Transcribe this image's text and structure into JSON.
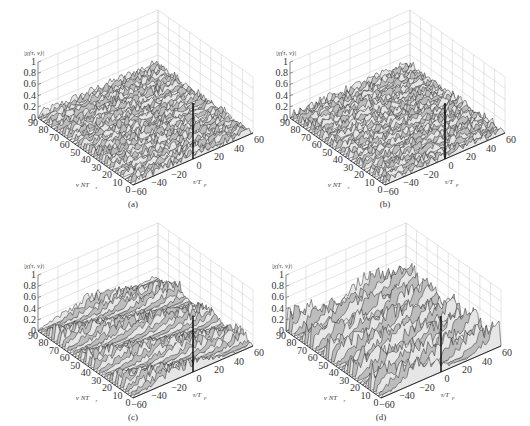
{
  "figure": {
    "panels": [
      {
        "id": "a",
        "caption": "(a)",
        "pattern": "noise",
        "offset": [
          0,
          0
        ]
      },
      {
        "id": "b",
        "caption": "(b)",
        "pattern": "noise",
        "offset": [
          252,
          0
        ]
      },
      {
        "id": "c",
        "caption": "(c)",
        "pattern": "ridges-light",
        "offset": [
          0,
          213
        ]
      },
      {
        "id": "d",
        "caption": "(d)",
        "pattern": "ridges-strong",
        "offset": [
          248,
          213
        ]
      }
    ]
  },
  "chart_data": [
    {
      "type": "surface3d",
      "panel": "(a)",
      "zlabel": "|χ(τ, ν)|",
      "xlabel": "τ/T_p",
      "ylabel": "ν NT_r",
      "zticks": [
        "0",
        "0.2",
        "0.4",
        "0.6",
        "0.8",
        "1"
      ],
      "xticks": [
        "-60",
        "-40",
        "-20",
        "0",
        "20",
        "40",
        "60"
      ],
      "yticks": [
        "0",
        "10",
        "20",
        "30",
        "40",
        "50",
        "60",
        "70",
        "80",
        "90"
      ],
      "zlim": [
        0,
        1
      ],
      "xlim": [
        -60,
        60
      ],
      "ylim": [
        0,
        90
      ],
      "peak": {
        "tau": 0,
        "nu": 0,
        "value": 1
      },
      "sidelobe_level": 0.15,
      "grid": true
    },
    {
      "type": "surface3d",
      "panel": "(b)",
      "zlabel": "|χ(τ, ν)|",
      "xlabel": "τ/T_p",
      "ylabel": "ν NT_r",
      "zticks": [
        "0",
        "0.2",
        "0.4",
        "0.6",
        "0.8",
        "1"
      ],
      "xticks": [
        "-60",
        "-40",
        "-20",
        "0",
        "20",
        "40",
        "60"
      ],
      "yticks": [
        "0",
        "10",
        "20",
        "30",
        "40",
        "50",
        "60",
        "70",
        "80",
        "90"
      ],
      "zlim": [
        0,
        1
      ],
      "xlim": [
        -60,
        60
      ],
      "ylim": [
        0,
        90
      ],
      "peak": {
        "tau": 0,
        "nu": 0,
        "value": 1
      },
      "sidelobe_level": 0.15,
      "grid": true
    },
    {
      "type": "surface3d",
      "panel": "(c)",
      "zlabel": "|χ(τ, ν)|",
      "xlabel": "τ/T_p",
      "ylabel": "ν NT_r",
      "zticks": [
        "0",
        "0.2",
        "0.4",
        "0.6",
        "0.8",
        "1"
      ],
      "xticks": [
        "-60",
        "-40",
        "-20",
        "0",
        "20",
        "40",
        "60"
      ],
      "yticks": [
        "0",
        "10",
        "20",
        "30",
        "40",
        "50",
        "60",
        "70",
        "80",
        "90"
      ],
      "zlim": [
        0,
        1
      ],
      "xlim": [
        -60,
        60
      ],
      "ylim": [
        0,
        90
      ],
      "peak": {
        "tau": 0,
        "nu": 0,
        "value": 1
      },
      "sidelobe_level": 0.2,
      "grid": true
    },
    {
      "type": "surface3d",
      "panel": "(d)",
      "zlabel": "|χ(τ, ν)|",
      "xlabel": "τ/T_p",
      "ylabel": "ν NT_r",
      "zticks": [
        "0",
        "0.2",
        "0.4",
        "0.6",
        "0.8",
        "1"
      ],
      "xticks": [
        "-60",
        "-40",
        "-20",
        "0",
        "20",
        "40",
        "60"
      ],
      "yticks": [
        "0",
        "10",
        "20",
        "30",
        "40",
        "50",
        "60",
        "70",
        "80",
        "90"
      ],
      "zlim": [
        0,
        1
      ],
      "xlim": [
        -60,
        60
      ],
      "ylim": [
        0,
        90
      ],
      "peak": {
        "tau": 0,
        "nu": 0,
        "value": 1
      },
      "sidelobe_level": 0.3,
      "grid": true
    }
  ]
}
